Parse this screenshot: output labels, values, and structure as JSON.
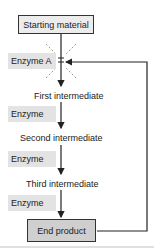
{
  "diagram": {
    "type": "metabolic-pathway-feedback-inhibition",
    "start": "Starting material",
    "end": "End product",
    "enzyme_a": {
      "label": "Enzyme A",
      "inhibited": true
    },
    "intermediates": [
      "First intermediate",
      "Second intermediate",
      "Third intermediate"
    ],
    "enzymes": [
      "Enzyme",
      "Enzyme",
      "Enzyme"
    ],
    "feedback_arrow": {
      "from": "End product",
      "to": "Enzyme A"
    },
    "colors": {
      "box_fill": "#e6e6e6",
      "end_fill": "#cfcfcf",
      "line": "#222222"
    }
  }
}
